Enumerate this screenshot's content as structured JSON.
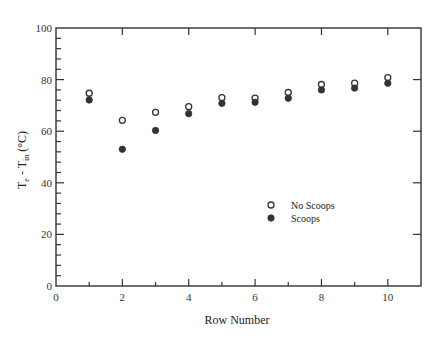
{
  "chart_data": {
    "type": "scatter",
    "title": "",
    "xlabel": "Row Number",
    "ylabel": "Te - Tin (°C)",
    "ylabel_parts": {
      "main1": "T",
      "sub1": "e",
      "mid": " - T",
      "sub2": "in",
      "unit": " (°C)"
    },
    "xlim": [
      0,
      11
    ],
    "ylim": [
      0,
      100
    ],
    "x_ticks": [
      0,
      2,
      4,
      6,
      8,
      10
    ],
    "y_ticks": [
      0,
      20,
      40,
      60,
      80,
      100
    ],
    "grid": false,
    "legend_position": "center-right (inside plot)",
    "x": [
      1,
      2,
      3,
      4,
      5,
      6,
      7,
      8,
      9,
      10
    ],
    "series": [
      {
        "name": "No Scoops",
        "marker": "open-circle",
        "values": [
          74.7,
          64.2,
          67.3,
          69.5,
          73.0,
          72.8,
          75.0,
          78.1,
          78.6,
          80.8
        ]
      },
      {
        "name": "Scoops",
        "marker": "filled-circle",
        "values": [
          72.1,
          53.0,
          60.3,
          66.8,
          70.8,
          71.2,
          72.8,
          76.0,
          76.7,
          78.6
        ]
      }
    ]
  },
  "legend": {
    "items": [
      {
        "label": "No Scoops",
        "marker": "open-circle"
      },
      {
        "label": "Scoops",
        "marker": "filled-circle"
      }
    ]
  },
  "colors": {
    "axis": "#333333",
    "marker": "#333333",
    "background": "#ffffff"
  }
}
